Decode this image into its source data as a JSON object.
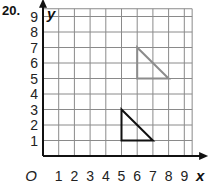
{
  "problem": {
    "number": "20."
  },
  "graph": {
    "x_axis_label": "x",
    "y_axis_label": "y",
    "origin_label": "O",
    "x_ticks": [
      "1",
      "2",
      "3",
      "4",
      "5",
      "6",
      "7",
      "8",
      "9"
    ],
    "y_ticks": [
      "1",
      "2",
      "3",
      "4",
      "5",
      "6",
      "7",
      "8",
      "9"
    ],
    "grid_range": {
      "x": [
        0,
        9.5
      ],
      "y": [
        0,
        9.5
      ]
    },
    "colors": {
      "grid": "#8a8a8a",
      "axis": "#111111",
      "preimage": "#111111",
      "image": "#8c8c8c"
    }
  },
  "chart_data": {
    "type": "scatter",
    "title": "",
    "xlabel": "x",
    "ylabel": "y",
    "xlim": [
      0,
      9
    ],
    "ylim": [
      0,
      9
    ],
    "grid": true,
    "shapes": [
      {
        "name": "original triangle",
        "color": "#111111",
        "vertices": [
          [
            5,
            3
          ],
          [
            5,
            1
          ],
          [
            7,
            1
          ]
        ]
      },
      {
        "name": "translated triangle",
        "color": "#8c8c8c",
        "vertices": [
          [
            6,
            7
          ],
          [
            6,
            5
          ],
          [
            8,
            5
          ]
        ]
      }
    ]
  }
}
